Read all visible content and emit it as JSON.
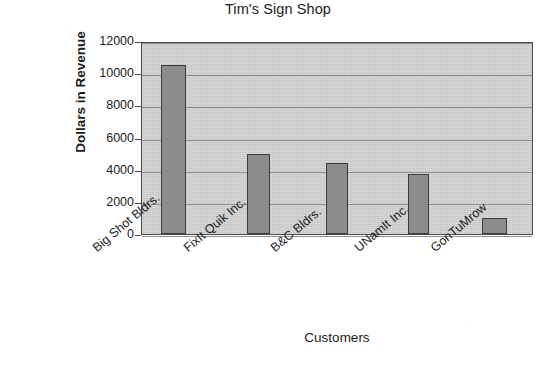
{
  "chart_data": {
    "type": "bar",
    "title": "Tim's Sign Shop",
    "xlabel": "Customers",
    "ylabel": "Dollars in Revenue",
    "categories": [
      "Big Shot Bldrs.",
      "FixIt Quik Inc.",
      "B&C Bldrs.",
      "UNamIt Inc.",
      "GonTuMrow"
    ],
    "values": [
      10500,
      5000,
      4400,
      3750,
      1000
    ],
    "ylim": [
      0,
      12000
    ],
    "yticks": [
      0,
      2000,
      4000,
      6000,
      8000,
      10000,
      12000
    ],
    "ytick_labels": [
      "0",
      "2000",
      "4000",
      "6000",
      "8000",
      "10000",
      "12000"
    ],
    "grid": true,
    "legend": "none",
    "colors": {
      "bar_fill": "#8c8c8c",
      "bar_edge": "#3b3b3b",
      "plot_background": "#d2d2d2",
      "gridline": "#8d8d8d",
      "axis": "#4a4a4a",
      "text": "#1c1c1c",
      "page_background": "#ffffff"
    }
  }
}
